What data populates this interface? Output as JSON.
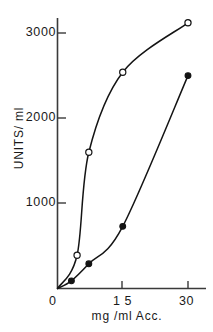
{
  "chart_data": {
    "type": "line",
    "title": "",
    "xlabel": "mg/ml  Acc.",
    "ylabel": "UNITS/ ml",
    "xlim": [
      0,
      33
    ],
    "ylim": [
      0,
      3300
    ],
    "grid": false,
    "legend": "none",
    "x_ticks": [
      {
        "value": 0,
        "label": "0"
      },
      {
        "value": 15,
        "label": "1 5"
      },
      {
        "value": 30,
        "label": "30"
      }
    ],
    "y_ticks": [
      {
        "value": 1000,
        "label": "1000"
      },
      {
        "value": 2000,
        "label": "2000"
      },
      {
        "value": 3000,
        "label": "3000"
      }
    ],
    "series": [
      {
        "name": "open-circle-series",
        "marker": "open-circle",
        "points": [
          {
            "x": 0.0,
            "y": 0
          },
          {
            "x": 4.5,
            "y": 390
          },
          {
            "x": 7.2,
            "y": 1600
          },
          {
            "x": 15.0,
            "y": 2540
          },
          {
            "x": 30.0,
            "y": 3120
          }
        ]
      },
      {
        "name": "filled-circle-series",
        "marker": "filled-circle",
        "points": [
          {
            "x": 0.0,
            "y": 0
          },
          {
            "x": 3.2,
            "y": 90
          },
          {
            "x": 7.2,
            "y": 290
          },
          {
            "x": 15.0,
            "y": 730
          },
          {
            "x": 30.0,
            "y": 2500
          }
        ]
      }
    ]
  },
  "axes": {
    "y_tick_3000": "3000",
    "y_tick_2000": "2000",
    "y_tick_1000": "1000",
    "x_tick_0": "0",
    "x_tick_15": "1 5",
    "x_tick_30": "30",
    "y_title": "UNITS/ ml",
    "x_title": "mg /ml   Acc."
  },
  "colors": {
    "axis": "#3a3a3a",
    "curve": "#141414",
    "marker_fill": "#141414",
    "marker_open_fill": "#ffffff",
    "background": "#ffffff"
  }
}
